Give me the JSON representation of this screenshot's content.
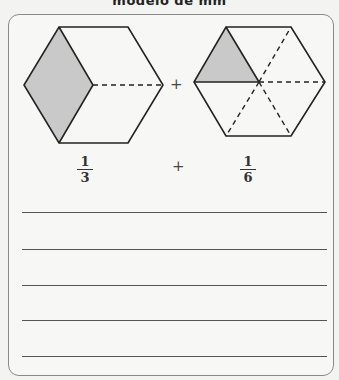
{
  "header": {
    "title": "modelo de mm"
  },
  "models": [
    {
      "name": "hexagon-thirds",
      "fraction": {
        "numerator": "1",
        "denominator": "3"
      },
      "shaded_parts": 1,
      "total_parts": 3
    },
    {
      "name": "hexagon-sixths",
      "fraction": {
        "numerator": "1",
        "denominator": "6"
      },
      "shaded_parts": 1,
      "total_parts": 6
    }
  ],
  "operators": {
    "figures_plus": "+",
    "fractions_plus": "+"
  },
  "answer_lines": 5,
  "colors": {
    "shade": "#c9c9c9",
    "stroke": "#222222",
    "border": "#8a8a8a"
  }
}
